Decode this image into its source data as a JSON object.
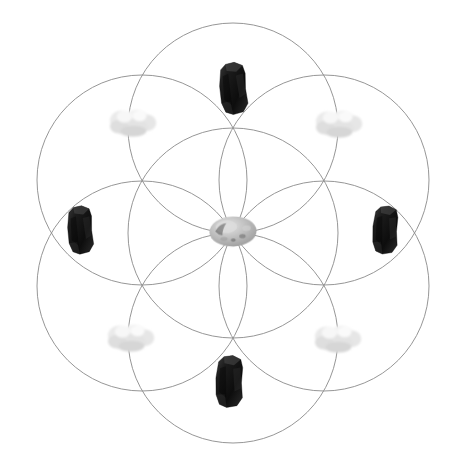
{
  "image": {
    "title": "Seed of Life crystal grid",
    "width": 475,
    "height": 462,
    "background_color": "#ffffff"
  },
  "geometry": {
    "name": "seed-of-life",
    "line_color": "#8a8a8a",
    "line_width": 0.9,
    "center": {
      "x": 233,
      "y": 233
    },
    "radius": 105,
    "circle_count": 7,
    "circles": [
      {
        "id": "circle-center",
        "cx": 233,
        "cy": 233,
        "r": 105
      },
      {
        "id": "circle-top",
        "cx": 233,
        "cy": 128,
        "r": 105
      },
      {
        "id": "circle-upper-right",
        "cx": 324,
        "cy": 180,
        "r": 105
      },
      {
        "id": "circle-lower-right",
        "cx": 324,
        "cy": 286,
        "r": 105
      },
      {
        "id": "circle-bottom",
        "cx": 233,
        "cy": 338,
        "r": 105
      },
      {
        "id": "circle-lower-left",
        "cx": 142,
        "cy": 286,
        "r": 105
      },
      {
        "id": "circle-upper-left",
        "cx": 142,
        "cy": 180,
        "r": 105
      }
    ]
  },
  "stones": [
    {
      "id": "stone-top",
      "label": "Top dark tourmaline stone",
      "kind": "dark",
      "color": "#171717",
      "x": 233,
      "y": 88,
      "width": 38,
      "height": 55,
      "rotation": -4
    },
    {
      "id": "stone-upper-right",
      "label": "Upper right white quartz stone",
      "kind": "white",
      "color": "#e8e8e8",
      "x": 338,
      "y": 123,
      "width": 62,
      "height": 38,
      "rotation": 0
    },
    {
      "id": "stone-right",
      "label": "Right dark tourmaline stone",
      "kind": "dark",
      "color": "#171717",
      "x": 385,
      "y": 230,
      "width": 34,
      "height": 52,
      "rotation": 3
    },
    {
      "id": "stone-lower-right",
      "label": "Lower right white quartz stone",
      "kind": "white",
      "color": "#e8e8e8",
      "x": 337,
      "y": 338,
      "width": 62,
      "height": 38,
      "rotation": 0
    },
    {
      "id": "stone-bottom",
      "label": "Bottom dark tourmaline stone",
      "kind": "dark",
      "color": "#171717",
      "x": 229,
      "y": 381,
      "width": 38,
      "height": 55,
      "rotation": 2
    },
    {
      "id": "stone-lower-left",
      "label": "Lower left white quartz stone",
      "kind": "white",
      "color": "#e8e8e8",
      "x": 130,
      "y": 337,
      "width": 62,
      "height": 38,
      "rotation": 0
    },
    {
      "id": "stone-left",
      "label": "Left dark tourmaline stone",
      "kind": "dark",
      "color": "#171717",
      "x": 80,
      "y": 230,
      "width": 34,
      "height": 52,
      "rotation": -3
    },
    {
      "id": "stone-upper-left",
      "label": "Upper left white quartz stone",
      "kind": "white",
      "color": "#e8e8e8",
      "x": 132,
      "y": 122,
      "width": 62,
      "height": 38,
      "rotation": 0
    },
    {
      "id": "stone-center",
      "label": "Center grey moonstone",
      "kind": "grey",
      "color": "#b8b8b8",
      "x": 233,
      "y": 231,
      "width": 50,
      "height": 33,
      "rotation": -2
    }
  ]
}
